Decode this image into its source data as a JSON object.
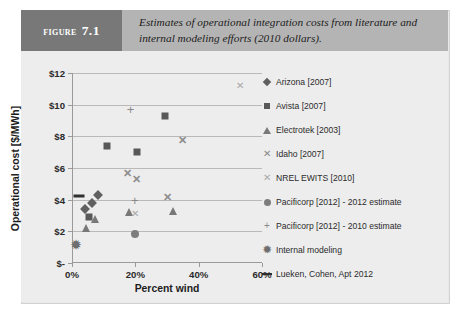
{
  "figure": {
    "label_word": "Figure",
    "label_number": "7.1",
    "caption": "Estimates of operational integration costs from literature and internal modeling efforts (2010 dollars)."
  },
  "chart_data": {
    "type": "scatter",
    "title": "",
    "xlabel": "Percent wind",
    "ylabel": "Operational cost [$/MWh]",
    "xlim": [
      0,
      60
    ],
    "ylim": [
      0,
      12
    ],
    "xticks": [
      0,
      20,
      40,
      60
    ],
    "xticklabels": [
      "0%",
      "20%",
      "40%",
      "60%"
    ],
    "yticks": [
      0,
      2,
      4,
      6,
      8,
      10,
      12
    ],
    "yticklabels": [
      "$-",
      "$2",
      "$4",
      "$6",
      "$8",
      "$10",
      "$12"
    ],
    "grid": "horizontal",
    "legend_position": "right",
    "series": [
      {
        "name": "Arizona [2007]",
        "marker": "diamond",
        "color": "#606060",
        "points": [
          {
            "x": 4.0,
            "y": 3.4
          },
          {
            "x": 6.2,
            "y": 3.8
          },
          {
            "x": 8.2,
            "y": 4.3
          }
        ]
      },
      {
        "name": "Avista [2007]",
        "marker": "square",
        "color": "#585858",
        "points": [
          {
            "x": 5.3,
            "y": 2.9
          },
          {
            "x": 11.0,
            "y": 7.4
          },
          {
            "x": 20.5,
            "y": 7.0
          },
          {
            "x": 29.5,
            "y": 9.3
          }
        ]
      },
      {
        "name": "Electrotek [2003]",
        "marker": "triangle",
        "color": "#787878",
        "points": [
          {
            "x": 4.3,
            "y": 2.2
          },
          {
            "x": 7.2,
            "y": 2.8
          },
          {
            "x": 18.0,
            "y": 3.2
          },
          {
            "x": 32.0,
            "y": 3.3
          }
        ]
      },
      {
        "name": "Idaho [2007]",
        "marker": "x",
        "color": "#8d8d8d",
        "points": [
          {
            "x": 17.5,
            "y": 5.7
          },
          {
            "x": 20.3,
            "y": 5.3
          },
          {
            "x": 30.2,
            "y": 4.2
          },
          {
            "x": 35.0,
            "y": 7.8
          }
        ]
      },
      {
        "name": "NREL EWITS [2010]",
        "marker": "x-thin",
        "color": "#a8a8a8",
        "points": [
          {
            "x": 20.0,
            "y": 3.1
          },
          {
            "x": 53.0,
            "y": 11.2
          }
        ]
      },
      {
        "name": "Pacificorp [2012] - 2012 estimate",
        "marker": "circle",
        "color": "#7d7d7d",
        "points": [
          {
            "x": 20.0,
            "y": 1.85
          }
        ]
      },
      {
        "name": "Pacificorp [2012] - 2010 estimate",
        "marker": "plus",
        "color": "#8a8a8a",
        "points": [
          {
            "x": 19.8,
            "y": 4.0
          },
          {
            "x": 18.5,
            "y": 9.75
          }
        ]
      },
      {
        "name": "Internal modeling",
        "marker": "star",
        "color": "#6e6e6e",
        "points": [
          {
            "x": 1.3,
            "y": 1.15
          }
        ]
      },
      {
        "name": "Lueken, Cohen, Apt 2012",
        "marker": "dash",
        "color": "#2f2f2f",
        "points": [
          {
            "x": 2.3,
            "y": 4.25
          }
        ]
      }
    ]
  }
}
